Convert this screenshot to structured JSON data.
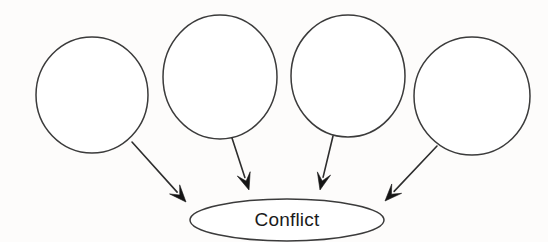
{
  "diagram": {
    "type": "convergence-diagram",
    "background_color": "#fdfcfb",
    "stroke_color": "#3b3b3b",
    "arrow_color": "#151515",
    "text_color": "#1b1b1b",
    "canvas": {
      "width": 548,
      "height": 242
    },
    "center_node": {
      "id": "conflict",
      "label": "Conflict",
      "shape": "ellipse",
      "cx": 287,
      "cy": 220,
      "rx": 97,
      "ry": 21,
      "fill": "#ffffff",
      "font_size": 19
    },
    "source_nodes": [
      {
        "id": "cause-1",
        "label": "",
        "shape": "circle",
        "cx": 92,
        "cy": 95,
        "rx": 56,
        "ry": 58,
        "fill": "#ffffff"
      },
      {
        "id": "cause-2",
        "label": "",
        "shape": "circle",
        "cx": 220,
        "cy": 77,
        "rx": 57,
        "ry": 62,
        "fill": "#ffffff"
      },
      {
        "id": "cause-3",
        "label": "",
        "shape": "circle",
        "cx": 348,
        "cy": 76,
        "rx": 57,
        "ry": 61,
        "fill": "#ffffff"
      },
      {
        "id": "cause-4",
        "label": "",
        "shape": "circle",
        "cx": 472,
        "cy": 96,
        "rx": 58,
        "ry": 59,
        "fill": "#ffffff"
      }
    ],
    "connectors": [
      {
        "id": "arrow-1",
        "from": "cause-1",
        "to": "conflict",
        "x1": 132,
        "y1": 142,
        "x2": 186,
        "y2": 202,
        "head_size": 17
      },
      {
        "id": "arrow-2",
        "from": "cause-2",
        "to": "conflict",
        "x1": 232,
        "y1": 138,
        "x2": 249,
        "y2": 190,
        "head_size": 17
      },
      {
        "id": "arrow-3",
        "from": "cause-3",
        "to": "conflict",
        "x1": 333,
        "y1": 136,
        "x2": 320,
        "y2": 190,
        "head_size": 17
      },
      {
        "id": "arrow-4",
        "from": "cause-4",
        "to": "conflict",
        "x1": 437,
        "y1": 146,
        "x2": 385,
        "y2": 201,
        "head_size": 17
      }
    ]
  }
}
